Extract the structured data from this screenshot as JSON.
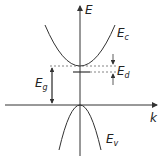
{
  "diagram": {
    "axes": {
      "y_label": "E",
      "x_label": "k"
    },
    "bands": {
      "conduction": {
        "symbol": "E",
        "subscript": "c"
      },
      "valence": {
        "symbol": "E",
        "subscript": "v"
      }
    },
    "levels": {
      "donor": {
        "symbol": "E",
        "subscript": "d"
      },
      "gap": {
        "symbol": "E",
        "subscript": "g"
      }
    },
    "colors": {
      "line": "#333333",
      "dashed": "#555555",
      "background": "#ffffff"
    }
  }
}
